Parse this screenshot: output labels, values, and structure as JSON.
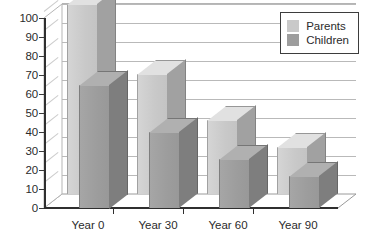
{
  "chart_data": {
    "type": "bar",
    "title": "",
    "subtitle": "",
    "xlabel": "",
    "ylabel": "",
    "categories": [
      "Year 0",
      "Year 30",
      "Year 60",
      "Year 90"
    ],
    "series": [
      {
        "name": "Parents",
        "color": "#c9c9c9",
        "values": [
          100,
          63,
          39,
          25
        ]
      },
      {
        "name": "Children",
        "color": "#9d9d9d",
        "values": [
          65,
          40,
          26,
          17
        ]
      }
    ],
    "ylim": [
      0,
      100
    ],
    "ytick_step": 10,
    "ytick_labels": [
      "0",
      "10",
      "20",
      "30",
      "40",
      "50",
      "60",
      "70",
      "80",
      "90",
      "100"
    ],
    "grid": true,
    "grid_axis": "y",
    "legend_position": "top-right",
    "style": "3d-grouped-bar",
    "background_color": "#ffffff",
    "axis_color": "#2f2f2f",
    "gridline_color": "#b9b9b9"
  },
  "legend": {
    "entries": [
      {
        "label": "Parents",
        "color": "#c9c9c9"
      },
      {
        "label": "Children",
        "color": "#9d9d9d"
      }
    ]
  }
}
